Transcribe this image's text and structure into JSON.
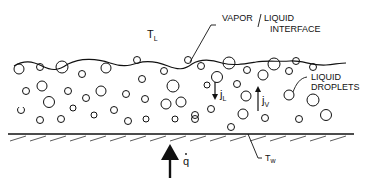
{
  "diagram": {
    "type": "physical-schematic",
    "labels": {
      "liquid_temp": "T",
      "liquid_temp_sub": "L",
      "interface_line1": "VAPOR / LIQUID",
      "interface_line1a": "VAPOR",
      "interface_line1b": "LIQUID",
      "interface_line2": "INTERFACE",
      "droplets_line1": "LIQUID",
      "droplets_line2": "DROPLETS",
      "flux_liquid": "j",
      "flux_liquid_sub": "L",
      "flux_vapor": "j",
      "flux_vapor_sub": "V",
      "heat_flux": "q",
      "wall_temp": "T",
      "wall_temp_sub": "w"
    },
    "colors": {
      "ink": "#111111",
      "background": "#ffffff"
    }
  }
}
